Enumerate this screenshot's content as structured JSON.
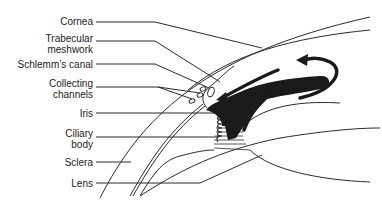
{
  "diagram": {
    "labels": [
      {
        "id": "cornea",
        "text": "Cornea"
      },
      {
        "id": "trabecular-meshwork",
        "text": "Trabecular\nmeshwork"
      },
      {
        "id": "schlemms-canal",
        "text": "Schlemm’s canal"
      },
      {
        "id": "collecting-channels",
        "text": "Collecting\nchannels"
      },
      {
        "id": "iris",
        "text": "Iris"
      },
      {
        "id": "ciliary-body",
        "text": "Ciliary\nbody"
      },
      {
        "id": "sclera",
        "text": "Sclera"
      },
      {
        "id": "lens",
        "text": "Lens"
      }
    ],
    "colors": {
      "line": "#2a2a2a",
      "fill": "#1a1a1a",
      "text": "#222222",
      "background": "#ffffff"
    }
  }
}
